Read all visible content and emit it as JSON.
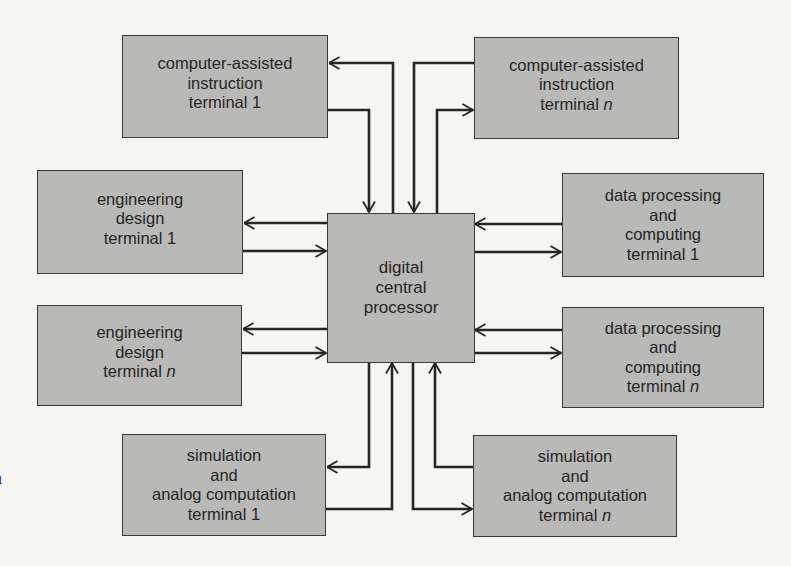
{
  "diagram": {
    "type": "block-diagram",
    "center": {
      "id": "processor",
      "lines": [
        "digital",
        "central",
        "processor"
      ]
    },
    "terminals": [
      {
        "id": "cai_1",
        "lines": [
          "computer-assisted",
          "instruction",
          "terminal 1"
        ],
        "position": "top-left"
      },
      {
        "id": "cai_n",
        "lines": [
          "computer-assisted",
          "instruction",
          "terminal"
        ],
        "suffix": "n",
        "position": "top-right"
      },
      {
        "id": "ed_1",
        "lines": [
          "engineering",
          "design",
          "terminal 1"
        ],
        "position": "left-upper"
      },
      {
        "id": "ed_n",
        "lines": [
          "engineering",
          "design",
          "terminal"
        ],
        "suffix": "n",
        "position": "left-lower"
      },
      {
        "id": "dp_1",
        "lines": [
          "data processing",
          "and",
          "computing",
          "terminal 1"
        ],
        "position": "right-upper"
      },
      {
        "id": "dp_n",
        "lines": [
          "data processing",
          "and",
          "computing",
          "terminal"
        ],
        "suffix": "n",
        "position": "right-lower"
      },
      {
        "id": "sim_1",
        "lines": [
          "simulation",
          "and",
          "analog computation",
          "terminal 1"
        ],
        "position": "bottom-left"
      },
      {
        "id": "sim_n",
        "lines": [
          "simulation",
          "and",
          "analog computation",
          "terminal"
        ],
        "suffix": "n",
        "position": "bottom-right"
      }
    ],
    "connections": [
      {
        "from": "processor",
        "to": "cai_1"
      },
      {
        "from": "cai_1",
        "to": "processor"
      },
      {
        "from": "processor",
        "to": "cai_n"
      },
      {
        "from": "cai_n",
        "to": "processor"
      },
      {
        "from": "processor",
        "to": "ed_1"
      },
      {
        "from": "ed_1",
        "to": "processor"
      },
      {
        "from": "processor",
        "to": "ed_n"
      },
      {
        "from": "ed_n",
        "to": "processor"
      },
      {
        "from": "processor",
        "to": "dp_1"
      },
      {
        "from": "dp_1",
        "to": "processor"
      },
      {
        "from": "processor",
        "to": "dp_n"
      },
      {
        "from": "dp_n",
        "to": "processor"
      },
      {
        "from": "processor",
        "to": "sim_1"
      },
      {
        "from": "sim_1",
        "to": "processor"
      },
      {
        "from": "processor",
        "to": "sim_n"
      },
      {
        "from": "sim_n",
        "to": "processor"
      }
    ],
    "margin_mark": "a",
    "colors": {
      "box_fill": "#b9b9b7",
      "line": "#262626",
      "background": "#f6f6f3"
    }
  }
}
